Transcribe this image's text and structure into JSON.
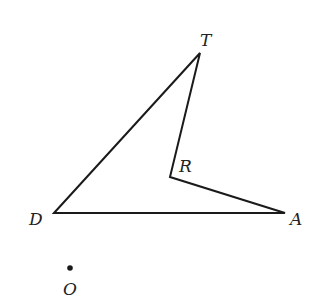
{
  "diagram": {
    "type": "geometry-figure",
    "vertices": [
      {
        "name": "T",
        "label": "T",
        "x": 200,
        "y": 53,
        "label_x": 200,
        "label_y": 46
      },
      {
        "name": "R",
        "label": "R",
        "x": 170,
        "y": 177,
        "label_x": 179,
        "label_y": 172
      },
      {
        "name": "A",
        "label": "A",
        "x": 285,
        "y": 213,
        "label_x": 290,
        "label_y": 225
      },
      {
        "name": "D",
        "label": "D",
        "x": 54,
        "y": 213,
        "label_x": 29,
        "label_y": 225
      }
    ],
    "edges": [
      [
        "D",
        "T"
      ],
      [
        "T",
        "R"
      ],
      [
        "R",
        "A"
      ],
      [
        "A",
        "D"
      ]
    ],
    "points": [
      {
        "name": "O",
        "label": "O",
        "x": 70,
        "y": 268,
        "label_x": 63,
        "label_y": 295
      }
    ],
    "colors": {
      "stroke": "#1a1a1a",
      "label": "#222222",
      "background": "#ffffff"
    }
  }
}
